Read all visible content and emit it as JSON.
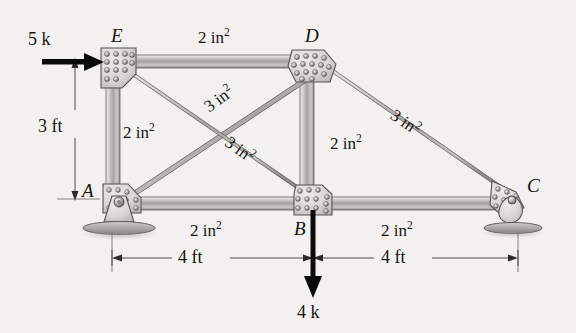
{
  "figure": {
    "background_color": "#f2f1ef",
    "ink_color": "#151515",
    "member_fill_light": "#e6e5e3",
    "member_fill_mid": "#a8a8a6",
    "gusset_fill": "#d8d7d4"
  },
  "joints": [
    {
      "id": "A",
      "label": "A",
      "x": 120,
      "y": 199,
      "support": "pin"
    },
    {
      "id": "B",
      "label": "B",
      "x": 313,
      "y": 204,
      "support": "none"
    },
    {
      "id": "C",
      "label": "C",
      "x": 510,
      "y": 200,
      "support": "roller"
    },
    {
      "id": "D",
      "label": "D",
      "x": 311,
      "y": 66,
      "support": "none"
    },
    {
      "id": "E",
      "label": "E",
      "x": 118,
      "y": 64,
      "support": "none"
    }
  ],
  "joint_labels": [
    {
      "text": "E",
      "x": 111,
      "y": 28
    },
    {
      "text": "D",
      "x": 305,
      "y": 28
    },
    {
      "text": "A",
      "x": 82,
      "y": 183
    },
    {
      "text": "B",
      "x": 295,
      "y": 221
    },
    {
      "text": "C",
      "x": 527,
      "y": 178
    }
  ],
  "members": [
    {
      "id": "ED",
      "from": "E",
      "to": "D",
      "area_label": "2 in",
      "area_exp": "2"
    },
    {
      "id": "AE",
      "from": "A",
      "to": "E",
      "area_label": "2 in",
      "area_exp": "2"
    },
    {
      "id": "AD",
      "from": "A",
      "to": "D",
      "area_label": "3 in",
      "area_exp": "2"
    },
    {
      "id": "EB",
      "from": "E",
      "to": "B",
      "area_label": "3 in",
      "area_exp": "2"
    },
    {
      "id": "DB",
      "from": "D",
      "to": "B",
      "area_label": "2 in",
      "area_exp": "2"
    },
    {
      "id": "DC",
      "from": "D",
      "to": "C",
      "area_label": "3 in",
      "area_exp": "2"
    },
    {
      "id": "AB",
      "from": "A",
      "to": "B",
      "area_label": "2 in",
      "area_exp": "2"
    },
    {
      "id": "BC",
      "from": "B",
      "to": "C",
      "area_label": "2 in",
      "area_exp": "2"
    }
  ],
  "area_labels": [
    {
      "member": "ED",
      "text": "2 in",
      "exp": "2",
      "x": 198,
      "y": 27,
      "rotate": 0
    },
    {
      "member": "AE",
      "text": "2 in",
      "exp": "2",
      "x": 123,
      "y": 122,
      "rotate": 0
    },
    {
      "member": "AD",
      "text": "3 in",
      "exp": "2",
      "x": 200,
      "y": 108,
      "rotate": -36
    },
    {
      "member": "EB",
      "text": "3 in",
      "exp": "2",
      "x": 233,
      "y": 136,
      "rotate": 36
    },
    {
      "member": "DB",
      "text": "2 in",
      "exp": "2",
      "x": 330,
      "y": 133,
      "rotate": 0
    },
    {
      "member": "DC",
      "text": "3 in",
      "exp": "2",
      "x": 398,
      "y": 112,
      "rotate": 34
    },
    {
      "member": "AB",
      "text": "2 in",
      "exp": "2",
      "x": 190,
      "y": 220,
      "rotate": 0
    },
    {
      "member": "BC",
      "text": "2 in",
      "exp": "2",
      "x": 381,
      "y": 220,
      "rotate": 0
    }
  ],
  "loads": [
    {
      "id": "load-5k",
      "label": "5 k",
      "magnitude": "5",
      "unit": "k",
      "direction": "right",
      "applied_at": "E",
      "label_x": 28,
      "label_y": 30
    },
    {
      "id": "load-4k",
      "label": "4 k",
      "magnitude": "4",
      "unit": "k",
      "direction": "down",
      "applied_at": "B",
      "label_x": 297,
      "label_y": 303
    }
  ],
  "dimensions": [
    {
      "id": "dim-3ft",
      "label": "3 ft",
      "value": "3",
      "unit": "ft",
      "orientation": "vertical",
      "label_x": 38,
      "label_y": 119
    },
    {
      "id": "dim-4ft-left",
      "label": "4 ft",
      "value": "4",
      "unit": "ft",
      "orientation": "horizontal",
      "label_x": 195,
      "label_y": 248
    },
    {
      "id": "dim-4ft-right",
      "label": "4 ft",
      "value": "4",
      "unit": "ft",
      "orientation": "horizontal",
      "label_x": 397,
      "label_y": 248
    }
  ],
  "supports": [
    {
      "joint": "A",
      "type": "pin",
      "name": "pin-support"
    },
    {
      "joint": "C",
      "type": "roller",
      "name": "roller-support"
    }
  ]
}
